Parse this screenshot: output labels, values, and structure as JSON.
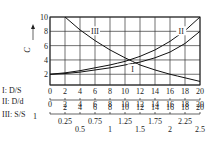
{
  "chart_data": {
    "type": "line",
    "title": "",
    "ylabel": "C",
    "xlim": [
      0,
      20
    ],
    "ylim": [
      0.5,
      10
    ],
    "y_ticks": [
      2,
      4,
      6,
      8,
      10
    ],
    "grid": true,
    "series": [
      {
        "name": "I",
        "x": [
          0,
          2,
          4,
          6,
          8,
          10,
          12,
          14,
          16,
          18,
          20
        ],
        "values": [
          2.0,
          2.1,
          2.3,
          2.6,
          2.9,
          3.3,
          3.7,
          4.3,
          5.1,
          6.3,
          8.0
        ]
      },
      {
        "name": "II",
        "x": [
          0,
          2,
          4,
          6,
          8,
          10,
          12,
          14,
          16,
          18,
          20
        ],
        "values": [
          2.0,
          2.2,
          2.5,
          2.9,
          3.3,
          3.8,
          4.5,
          5.4,
          6.6,
          8.1,
          10.0
        ]
      },
      {
        "name": "III",
        "x": [
          2,
          4,
          6,
          8,
          10,
          12,
          14,
          16,
          18,
          20
        ],
        "values": [
          10.0,
          8.2,
          6.7,
          5.4,
          4.3,
          3.3,
          2.6,
          2.0,
          1.5,
          1.0
        ]
      }
    ],
    "curve_labels": [
      {
        "text": "III",
        "x": 6,
        "y": 8
      },
      {
        "text": "II",
        "x": 17.5,
        "y": 8
      },
      {
        "text": "I",
        "x": 11,
        "y": 2.7
      }
    ],
    "x_scales": [
      {
        "name": "I: D/S",
        "ticks": [
          "0",
          "2",
          "4",
          "6",
          "8",
          "10",
          "12",
          "14",
          "16",
          "18",
          "20"
        ]
      },
      {
        "name": "II: D/d",
        "ticks": [
          "2",
          "4",
          "6",
          "8",
          "10",
          "12",
          "14",
          "16",
          "18",
          "20"
        ]
      },
      {
        "name": "III: S/S1",
        "ticks_upper": [
          "0.25",
          "0.75",
          "1.25",
          "1.75",
          "2.25"
        ],
        "ticks_lower": [
          "0.5",
          "1",
          "1.5",
          "2",
          "2.5"
        ]
      }
    ]
  },
  "axis": {
    "ylabel": "C"
  },
  "scales": {
    "s1_label": "I: D/S",
    "s2_label": "II: D/d",
    "s3_label": "III: S/S",
    "s3_sub": "1"
  }
}
